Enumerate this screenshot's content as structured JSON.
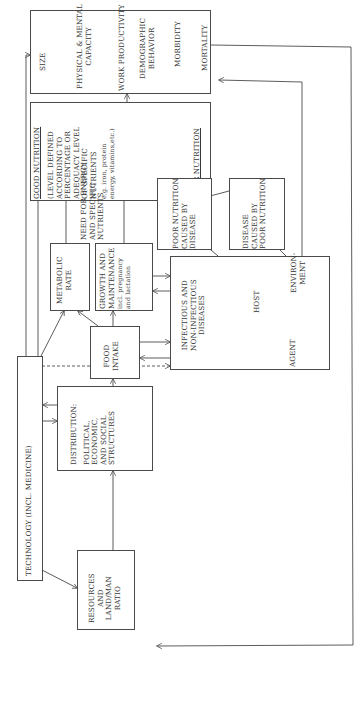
{
  "diagram": {
    "outcomes": {
      "items": [
        "SIZE",
        "PHYSICAL & MENTAL",
        "CAPACITY",
        "WORK PRODUCTIVITY",
        "DEMOGRAPHIC",
        "BEHAVIOR",
        "MORBIDITY",
        "MORTALITY"
      ]
    },
    "nutrition": {
      "good": "GOOD NUTRITION",
      "lines": [
        "(LEVEL DEFINED",
        "ACCORDING TO",
        "PERCENTAGE OR",
        "ADEQUACY LEVEL",
        "OF SPECIFIC",
        "NUTRIENTS"
      ],
      "example_lines": [
        "e.g. iron, protein",
        "energy, vitamins,etc.)"
      ],
      "poor": "POOR NUTRITION"
    },
    "need_label": [
      "NEED FOR ENERGY",
      "AND SPECIFIC",
      "NUTRIENTS"
    ],
    "poor_by_disease": [
      "POOR NUTRITION",
      "CAUSED BY",
      "DISEASE"
    ],
    "disease_by_poor": [
      "DISEASE",
      "CAUSED BY",
      "POOR NUTRITION"
    ],
    "metabolic": [
      "METABOLIC",
      "RATE"
    ],
    "growth": {
      "lines": [
        "GROWTH AND",
        "MAINTENANCE"
      ],
      "small": [
        "incl. pregnancy",
        "and lactation"
      ]
    },
    "diseases": {
      "title": [
        "INFECTIOUS AND",
        "NON-INFECTIOUS",
        "DISEASES"
      ],
      "host": "HOST",
      "agent": "AGENT",
      "environment": [
        "ENVIRON-",
        "MENT"
      ]
    },
    "food_intake": [
      "FOOD",
      "INTAKE"
    ],
    "technology": "TECHNOLOGY (INCL. MEDICINE)",
    "distribution": [
      "DISTRIBUTION:",
      "POLITICAL,",
      "ECONOMIC,",
      "AND SOCIAL",
      "STRUCTURES"
    ],
    "resources": [
      "RESOURCES",
      "AND",
      "LAND/MAN",
      "RATIO"
    ]
  }
}
